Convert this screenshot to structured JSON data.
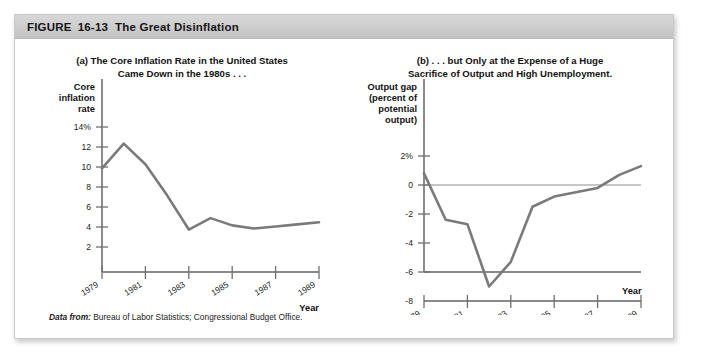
{
  "figure": {
    "label": "FIGURE",
    "number": "16-13",
    "title": "The Great Disinflation"
  },
  "source": {
    "lead": "Data from:",
    "text": "Bureau of Labor Statistics; Congressional Budget Office."
  },
  "colors": {
    "line": "#7a7a7a",
    "axis": "#6f6f6f",
    "header_bar": "#cfcfcf",
    "text": "#131313",
    "card_border": "#c9c9c9"
  },
  "chart_data": [
    {
      "type": "line",
      "panel": "a",
      "title": "(a) The Core Inflation Rate in the United States Came Down in the 1980s . . .",
      "title_line1": "(a) The Core Inflation Rate in the United States",
      "title_line2": "Came Down in the 1980s . . .",
      "ylabel": "Core inflation rate",
      "ylabel_lines": [
        "Core",
        "inflation",
        "rate"
      ],
      "xlabel": "Year",
      "ylim": [
        0,
        14
      ],
      "xlim": [
        1979,
        1989
      ],
      "yticks": [
        2,
        4,
        6,
        8,
        10,
        12,
        14
      ],
      "ytick_labels": [
        "2",
        "4",
        "6",
        "8",
        "10",
        "12",
        "14%"
      ],
      "xticks": [
        1979,
        1981,
        1983,
        1985,
        1987,
        1989
      ],
      "xtick_labels": [
        "1979",
        "1981",
        "1983",
        "1985",
        "1987",
        "1989"
      ],
      "grid": false,
      "legend": "none",
      "x": [
        1979,
        1980,
        1981,
        1982,
        1983,
        1984,
        1985,
        1986,
        1987,
        1988,
        1989
      ],
      "values": [
        10.0,
        12.4,
        10.4,
        7.4,
        4.1,
        5.2,
        4.5,
        4.2,
        4.4,
        4.6,
        4.8
      ]
    },
    {
      "type": "line",
      "panel": "b",
      "title": "(b) . . . but Only at the Expense of a Huge Sacrifice of Output and High Unemployment.",
      "title_line1": "(b) . . . but Only at the Expense of a Huge",
      "title_line2": "Sacrifice of Output and High Unemployment.",
      "ylabel": "Output gap (percent of potential output)",
      "ylabel_lines": [
        "Output gap",
        "(percent of",
        "potential",
        "output)"
      ],
      "xlabel": "Year",
      "ylim": [
        -8,
        2
      ],
      "xlim": [
        1979,
        1989
      ],
      "yticks": [
        -8,
        -6,
        -4,
        -2,
        0,
        2
      ],
      "ytick_labels": [
        "-8",
        "-6",
        "-4",
        "-2",
        "0",
        "2%"
      ],
      "xticks": [
        1979,
        1981,
        1983,
        1985,
        1987,
        1989
      ],
      "xtick_labels": [
        "1979",
        "1981",
        "1983",
        "1985",
        "1987",
        "1989"
      ],
      "grid": false,
      "zero_line": true,
      "legend": "none",
      "x": [
        1979,
        1980,
        1981,
        1982,
        1983,
        1984,
        1985,
        1986,
        1987,
        1988,
        1989
      ],
      "values": [
        0.8,
        -2.4,
        -2.7,
        -7.0,
        -5.3,
        -1.5,
        -0.8,
        -0.5,
        -0.2,
        0.7,
        1.3
      ]
    }
  ]
}
